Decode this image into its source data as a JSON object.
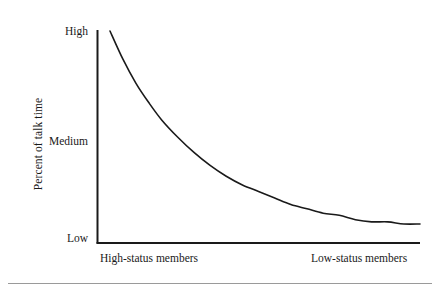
{
  "figure": {
    "background_color": "#ffffff",
    "ink_color": "#1a1a1a",
    "rule_color": "#9a9a9a"
  },
  "axes": {
    "y_title": "Percent of talk time",
    "y_ticks": [
      {
        "label": "High"
      },
      {
        "label": "Medium"
      },
      {
        "label": "Low"
      }
    ],
    "x_left_label": "High-status members",
    "x_right_label": "Low-status members"
  },
  "chart_data": {
    "type": "line",
    "title": "",
    "subtitle": "",
    "xlabel": "",
    "ylabel": "Percent of talk time",
    "x_tick_labels": [
      "High-status members",
      "Low-status members"
    ],
    "y_tick_labels": [
      "Low",
      "Medium",
      "High"
    ],
    "xlim": [
      0,
      100
    ],
    "ylim": [
      0,
      100
    ],
    "grid": false,
    "legend": "none",
    "annotations": [],
    "series": [
      {
        "name": "Percent of talk time by member status",
        "line_color": "#1a1a1a",
        "line_width": 1.6,
        "description": "Monotonic decreasing convex curve: talk time falls steeply from High for the highest-status members and flattens toward Low for low-status members.",
        "x": [
          4,
          8,
          12,
          16,
          20,
          25,
          30,
          35,
          40,
          45,
          50,
          55,
          60,
          65,
          70,
          75,
          80,
          85,
          90,
          95,
          100
        ],
        "y": [
          98,
          85,
          74,
          65,
          57,
          49,
          42,
          36,
          31,
          27,
          24,
          21,
          18,
          16,
          14,
          13,
          11,
          10,
          10,
          9,
          9
        ]
      }
    ]
  }
}
